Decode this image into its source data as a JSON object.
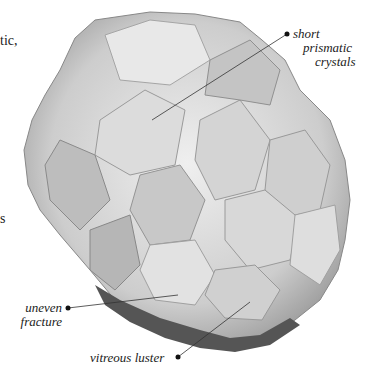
{
  "image": {
    "subject": "crystal cluster specimen",
    "background": "#ffffff",
    "tone": "grayscale"
  },
  "partial_text": {
    "top_left": "tic,",
    "mid_left": "s"
  },
  "annotations": [
    {
      "id": "short-prismatic-crystals",
      "lines": [
        "short",
        "prismatic",
        "crystals"
      ]
    },
    {
      "id": "uneven-fracture",
      "lines": [
        "uneven",
        "fracture"
      ]
    },
    {
      "id": "vitreous-luster",
      "lines": [
        "vitreous luster"
      ]
    }
  ]
}
